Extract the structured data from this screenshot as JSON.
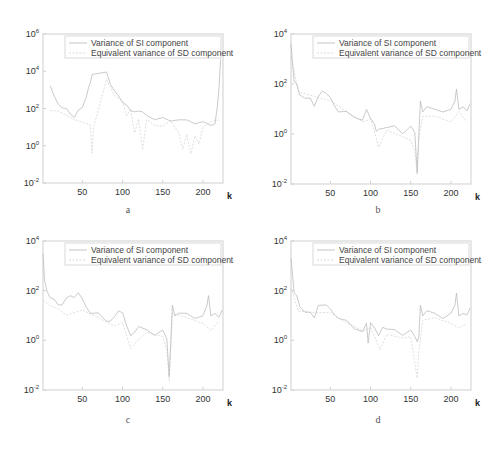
{
  "figure": {
    "legend": {
      "series1": "Variance of SI component",
      "series2": "Equivalent variance of SD component"
    },
    "xlabel": "k",
    "colors": {
      "series1": "#bdbdbd",
      "series2": "#d6d6d6",
      "axes": "#cfcfcf"
    }
  },
  "chart_data": [
    {
      "panel": "a",
      "type": "line",
      "title": "",
      "xlabel": "k",
      "ylabel": "",
      "yscale": "log",
      "xlim": [
        1,
        225
      ],
      "ylim_exp": [
        -2,
        6
      ],
      "xticks": [
        50,
        100,
        150,
        200
      ],
      "yticks": [
        "10^-2",
        "10^0",
        "10^2",
        "10^4",
        "10^6"
      ],
      "legend": [
        "Variance of SI component",
        "Equivalent variance of SD component"
      ],
      "legend_position": "upper right",
      "grid": false,
      "series": [
        {
          "name": "Variance of SI component",
          "x": [
            10,
            15,
            20,
            25,
            30,
            35,
            40,
            45,
            50,
            55,
            58,
            60,
            62,
            80,
            85,
            90,
            95,
            100,
            105,
            110,
            115,
            120,
            125,
            130,
            140,
            150,
            160,
            170,
            180,
            190,
            200,
            205,
            210,
            215,
            218,
            220,
            222
          ],
          "logy": [
            3.3,
            2.6,
            2.1,
            2.0,
            2.1,
            1.8,
            1.5,
            1.8,
            2.0,
            2.7,
            3.1,
            3.5,
            3.8,
            4.0,
            3.4,
            3.0,
            2.6,
            2.2,
            2.2,
            2.0,
            1.9,
            1.8,
            1.7,
            1.6,
            1.5,
            1.4,
            1.4,
            1.4,
            1.3,
            1.3,
            1.2,
            1.1,
            1.1,
            1.3,
            2.0,
            3.2,
            4.7
          ]
        },
        {
          "name": "Equivalent variance of SD component",
          "x": [
            10,
            20,
            40,
            60,
            62,
            64,
            80,
            90,
            100,
            105,
            110,
            115,
            120,
            125,
            130,
            140,
            150,
            160,
            170,
            175,
            180,
            185,
            190,
            195,
            200,
            210,
            220
          ],
          "logy": [
            2.0,
            1.8,
            1.5,
            1.2,
            -0.5,
            1.0,
            3.5,
            2.8,
            2.3,
            1.5,
            2.0,
            0.8,
            1.5,
            -0.3,
            1.3,
            1.2,
            1.0,
            1.3,
            0.8,
            -0.2,
            0.5,
            -0.5,
            0.6,
            0.2,
            1.0,
            1.2,
            1.5
          ]
        }
      ]
    },
    {
      "panel": "b",
      "type": "line",
      "xlabel": "k",
      "yscale": "log",
      "xlim": [
        1,
        225
      ],
      "ylim_exp": [
        -2,
        4
      ],
      "xticks": [
        50,
        100,
        150,
        200
      ],
      "yticks": [
        "10^-2",
        "10^0",
        "10^2",
        "10^4"
      ],
      "legend": [
        "Variance of SI component",
        "Equivalent variance of SD component"
      ],
      "legend_position": "upper right",
      "grid": false,
      "series": [
        {
          "name": "Variance of SI component",
          "x": [
            1,
            3,
            5,
            8,
            12,
            18,
            25,
            30,
            35,
            40,
            45,
            50,
            55,
            60,
            70,
            80,
            90,
            95,
            100,
            105,
            107,
            110,
            120,
            130,
            140,
            150,
            155,
            158,
            160,
            162,
            165,
            170,
            180,
            190,
            200,
            205,
            207,
            210,
            215,
            220,
            224
          ],
          "logy": [
            3.5,
            2.8,
            2.2,
            1.9,
            1.6,
            1.5,
            1.4,
            1.2,
            1.6,
            1.7,
            1.5,
            1.4,
            1.2,
            1.0,
            0.8,
            0.7,
            0.6,
            0.9,
            0.5,
            0.4,
            0.0,
            0.3,
            0.2,
            0.3,
            0.1,
            0.2,
            0.0,
            -1.5,
            0.0,
            1.2,
            1.0,
            1.1,
            0.9,
            1.0,
            0.9,
            1.2,
            1.8,
            1.0,
            1.2,
            1.0,
            1.1
          ]
        },
        {
          "name": "Equivalent variance of SD component",
          "x": [
            1,
            10,
            30,
            50,
            70,
            90,
            100,
            105,
            110,
            120,
            140,
            150,
            155,
            158,
            160,
            165,
            180,
            200,
            210,
            220
          ],
          "logy": [
            3.0,
            1.8,
            1.5,
            1.2,
            0.9,
            0.6,
            0.5,
            0.0,
            -0.5,
            0.2,
            0.0,
            -0.3,
            -0.8,
            -1.5,
            -0.2,
            0.8,
            0.6,
            0.5,
            0.8,
            0.6
          ]
        }
      ]
    },
    {
      "panel": "c",
      "type": "line",
      "xlabel": "k",
      "yscale": "log",
      "xlim": [
        1,
        225
      ],
      "ylim_exp": [
        -2,
        4
      ],
      "xticks": [
        50,
        100,
        150,
        200
      ],
      "yticks": [
        "10^-2",
        "10^0",
        "10^2",
        "10^4"
      ],
      "legend": [
        "Variance of SI component",
        "Equivalent variance of SD component"
      ],
      "legend_position": "upper right",
      "grid": false,
      "series": [
        {
          "name": "Variance of SI component",
          "x": [
            1,
            3,
            6,
            10,
            15,
            20,
            25,
            30,
            35,
            40,
            45,
            50,
            55,
            60,
            70,
            80,
            85,
            90,
            95,
            100,
            105,
            110,
            115,
            120,
            130,
            140,
            150,
            155,
            158,
            160,
            162,
            165,
            170,
            180,
            190,
            200,
            205,
            207,
            210,
            215,
            220,
            224
          ],
          "logy": [
            3.4,
            2.4,
            2.0,
            1.8,
            1.6,
            1.3,
            1.4,
            1.8,
            1.9,
            1.7,
            1.8,
            1.6,
            1.4,
            1.2,
            1.0,
            0.8,
            0.9,
            1.0,
            1.1,
            1.0,
            0.6,
            0.3,
            0.4,
            0.5,
            0.4,
            0.3,
            0.3,
            0.0,
            -1.4,
            0.0,
            1.3,
            1.1,
            1.1,
            1.0,
            1.0,
            0.9,
            1.3,
            1.8,
            1.0,
            1.2,
            1.0,
            1.1
          ]
        },
        {
          "name": "Equivalent variance of SD component",
          "x": [
            1,
            10,
            20,
            30,
            50,
            70,
            90,
            100,
            110,
            120,
            130,
            150,
            155,
            158,
            162,
            180,
            200,
            210,
            220
          ],
          "logy": [
            1.5,
            1.5,
            1.2,
            1.0,
            1.1,
            0.9,
            0.7,
            0.6,
            -0.3,
            0.1,
            0.2,
            0.1,
            -0.5,
            -1.5,
            1.0,
            0.8,
            0.7,
            0.3,
            0.9
          ]
        }
      ]
    },
    {
      "panel": "d",
      "type": "line",
      "xlabel": "k",
      "yscale": "log",
      "xlim": [
        1,
        225
      ],
      "ylim_exp": [
        -2,
        4
      ],
      "xticks": [
        50,
        100,
        150,
        200
      ],
      "yticks": [
        "10^-2",
        "10^0",
        "10^2",
        "10^4"
      ],
      "legend": [
        "Variance of SI component",
        "Equivalent variance of SD component"
      ],
      "legend_position": "upper right",
      "grid": false,
      "series": [
        {
          "name": "Variance of SI component",
          "x": [
            1,
            3,
            5,
            8,
            12,
            18,
            25,
            30,
            35,
            40,
            45,
            50,
            55,
            60,
            70,
            80,
            90,
            95,
            97,
            100,
            105,
            110,
            115,
            120,
            130,
            140,
            150,
            155,
            158,
            160,
            162,
            165,
            170,
            180,
            190,
            200,
            205,
            207,
            210,
            215,
            220,
            224
          ],
          "logy": [
            3.2,
            2.6,
            2.0,
            1.7,
            1.4,
            1.2,
            1.1,
            1.0,
            1.5,
            1.4,
            1.3,
            1.2,
            1.1,
            1.0,
            0.7,
            0.5,
            0.4,
            0.6,
            0.0,
            0.6,
            0.5,
            0.3,
            0.6,
            0.4,
            0.4,
            0.3,
            0.3,
            0.1,
            0.0,
            0.2,
            1.3,
            1.1,
            1.2,
            1.0,
            1.0,
            1.0,
            1.3,
            1.9,
            1.0,
            1.2,
            1.1,
            1.2
          ]
        },
        {
          "name": "Equivalent variance of SD component",
          "x": [
            1,
            10,
            30,
            50,
            70,
            90,
            100,
            110,
            112,
            120,
            140,
            150,
            158,
            160,
            165,
            180,
            200,
            210,
            220
          ],
          "logy": [
            2.0,
            1.3,
            1.1,
            1.0,
            0.7,
            0.5,
            0.4,
            -0.2,
            -0.5,
            0.3,
            0.2,
            0.1,
            -1.4,
            -0.5,
            0.9,
            0.8,
            0.7,
            0.4,
            0.8
          ]
        }
      ]
    }
  ],
  "panels": [
    {
      "caption": "a",
      "yticks": [
        {
          "base": "10",
          "exp": "-2"
        },
        {
          "base": "10",
          "exp": "0"
        },
        {
          "base": "10",
          "exp": "2"
        },
        {
          "base": "10",
          "exp": "4"
        },
        {
          "base": "10",
          "exp": "6"
        }
      ],
      "xticks": [
        "50",
        "100",
        "150",
        "200"
      ]
    },
    {
      "caption": "b",
      "yticks": [
        {
          "base": "10",
          "exp": "-2"
        },
        {
          "base": "10",
          "exp": "0"
        },
        {
          "base": "10",
          "exp": "2"
        },
        {
          "base": "10",
          "exp": "4"
        }
      ],
      "xticks": [
        "50",
        "100",
        "150",
        "200"
      ]
    },
    {
      "caption": "c",
      "yticks": [
        {
          "base": "10",
          "exp": "-2"
        },
        {
          "base": "10",
          "exp": "0"
        },
        {
          "base": "10",
          "exp": "2"
        },
        {
          "base": "10",
          "exp": "4"
        }
      ],
      "xticks": [
        "50",
        "100",
        "150",
        "200"
      ]
    },
    {
      "caption": "d",
      "yticks": [
        {
          "base": "10",
          "exp": "-2"
        },
        {
          "base": "10",
          "exp": "0"
        },
        {
          "base": "10",
          "exp": "2"
        },
        {
          "base": "10",
          "exp": "4"
        }
      ],
      "xticks": [
        "50",
        "100",
        "150",
        "200"
      ]
    }
  ]
}
